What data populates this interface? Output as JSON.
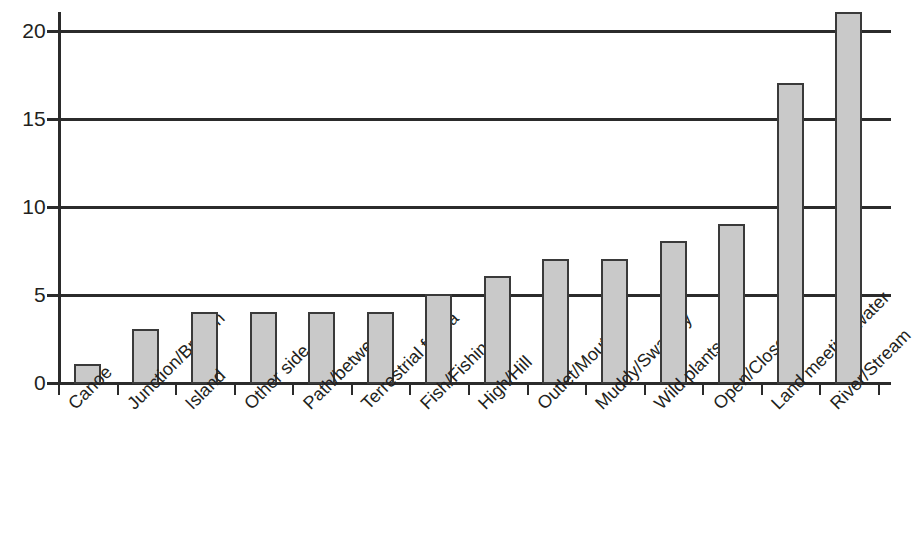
{
  "chart_data": {
    "type": "bar",
    "title": "",
    "subtitle": "",
    "xlabel": "",
    "ylabel": "",
    "ylim": [
      0,
      21.5
    ],
    "yticks": [
      0,
      5,
      10,
      15,
      20
    ],
    "ytick_labels": [
      "0",
      "5",
      "10",
      "15",
      "20"
    ],
    "grid": true,
    "grid_axis": "y",
    "legend": false,
    "legend_position": "none",
    "orientation": "vertical",
    "bar_fill_color": "#c9c9c9",
    "bar_edge_color": "#3a3a3a",
    "axis_color": "#2b2b2b",
    "text_color": "#231f20",
    "background_color": "#ffffff",
    "xtick_label_rotation": -45,
    "categories": [
      "Canoe",
      "Junction/Branch",
      "Island",
      "Other side",
      "Path/between",
      "Terrestrial fauna",
      "Fish/Fishing",
      "High/Hill",
      "Outlet/Mouth",
      "Muddy/Swampy",
      "Wild plants",
      "Open/Closed",
      "Land meeting water",
      "River/Stream"
    ],
    "values": [
      1,
      3,
      4,
      4,
      4,
      4,
      5,
      6,
      7,
      7,
      8,
      9,
      17,
      21
    ]
  }
}
